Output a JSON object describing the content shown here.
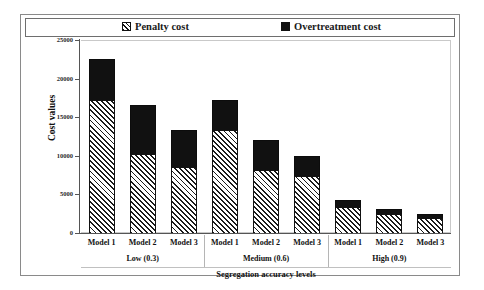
{
  "chart_data": {
    "type": "bar",
    "title": "",
    "xlabel": "Segregation accuracy levels",
    "ylabel": "Cost values",
    "ylim": [
      0,
      25000
    ],
    "yticks": [
      0,
      5000,
      10000,
      15000,
      20000,
      25000
    ],
    "ytick_labels": [
      "0",
      "5000",
      "10000",
      "15000",
      "20000",
      "25000"
    ],
    "grid": false,
    "stacked": true,
    "legend_position": "top",
    "categories": [
      "Model 1",
      "Model 2",
      "Model 3",
      "Model 1",
      "Model 2",
      "Model 3",
      "Model 1",
      "Model 2",
      "Model 3"
    ],
    "groups": [
      {
        "label": "Low (0.3)",
        "members": [
          "Model 1",
          "Model 2",
          "Model 3"
        ]
      },
      {
        "label": "Medium (0.6)",
        "members": [
          "Model 1",
          "Model 2",
          "Model 3"
        ]
      },
      {
        "label": "High (0.9)",
        "members": [
          "Model 1",
          "Model 2",
          "Model 3"
        ]
      }
    ],
    "series": [
      {
        "name": "Penalty cost",
        "pattern": "diagonal-hatch",
        "color": "#1a1a1a",
        "values": [
          17200,
          10200,
          8600,
          13300,
          8200,
          7400,
          3400,
          2400,
          1900
        ]
      },
      {
        "name": "Overtreatment cost",
        "pattern": "solid-dark",
        "color": "#111111",
        "values": [
          5300,
          6400,
          4700,
          3900,
          3900,
          2600,
          900,
          700,
          600
        ]
      }
    ],
    "totals": [
      22500,
      16600,
      13300,
      17200,
      12100,
      10000,
      4300,
      3100,
      2500
    ]
  },
  "legend": {
    "items": [
      {
        "label": "Penalty cost",
        "marker": "hatch-swatch"
      },
      {
        "label": "Overtreatment cost",
        "marker": "solid-swatch"
      }
    ]
  }
}
